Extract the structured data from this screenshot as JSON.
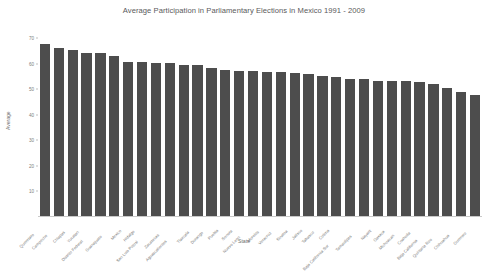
{
  "chart_data": {
    "type": "bar",
    "title": "Average Participation in Parliamentary Elections in Mexico 1991 - 2009",
    "xlabel": "State",
    "ylabel": "Average",
    "ylim": [
      0,
      72
    ],
    "yticks": [
      10,
      20,
      30,
      40,
      50,
      60,
      70
    ],
    "grid": false,
    "legend": null,
    "bar_color": "#4d4d4d",
    "categories": [
      "Queretaro",
      "Campeche",
      "Chiapas",
      "Yucatan",
      "Distrito Federal",
      "Guanajuato",
      "Mexico",
      "Hidalgo",
      "San Luis Potosi",
      "Zacatecas",
      "Aguascalientes",
      "Tlaxcala",
      "Durango",
      "Puebla",
      "Sonora",
      "Nuevo Leon",
      "Morelos",
      "Veracruz",
      "Sinaloa",
      "Jalisco",
      "Tabasco",
      "Colima",
      "Baja California Sur",
      "Tamaulipas",
      "Nayarit",
      "Oaxaca",
      "Michoacan",
      "Coahuila",
      "Baja California",
      "Quintana Roo",
      "Chihuahua",
      "Guerrero"
    ],
    "values": [
      67.8,
      66.1,
      65.4,
      64.1,
      64.0,
      63.1,
      60.8,
      60.7,
      60.4,
      60.2,
      59.6,
      59.3,
      58.2,
      57.5,
      57.3,
      57.2,
      56.9,
      56.6,
      56.2,
      55.8,
      55.1,
      54.7,
      54.2,
      53.9,
      53.3,
      53.2,
      53.1,
      53.0,
      52.1,
      50.4,
      48.8,
      47.6
    ]
  }
}
